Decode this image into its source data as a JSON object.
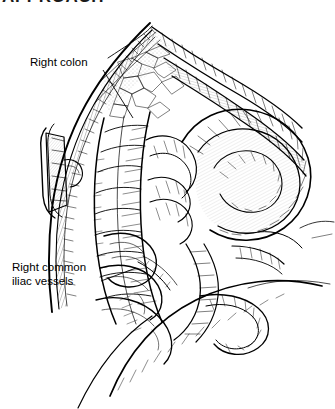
{
  "page": {
    "header_text": "APPROACH",
    "background_color": "#ffffff",
    "ink_color": "#000000",
    "width": 335,
    "height": 409
  },
  "figure": {
    "style": "pen-and-ink line drawing with cross-hatching",
    "medium": "black and white medical illustration"
  },
  "annotations": [
    {
      "id": "right-colon",
      "text": "Right colon",
      "lines": [
        "Right colon"
      ],
      "leader_from": {
        "x": 103,
        "y": 70
      },
      "leader_to": {
        "x": 133,
        "y": 118
      }
    },
    {
      "id": "right-common-iliac-vessels",
      "text": "Right common iliac vessels",
      "lines": [
        "Right common",
        "iliac vessels"
      ],
      "leader_from": {
        "x": 101,
        "y": 281
      },
      "leader_to": {
        "x": 136,
        "y": 268
      }
    }
  ],
  "structures": [
    {
      "name": "abdominal-incision-edge",
      "label": "Abdominal incision edge"
    },
    {
      "name": "surgical-retractor-clamp",
      "label": "Surgical retractor clamp"
    },
    {
      "name": "right-colon",
      "label": "Right colon"
    },
    {
      "name": "small-bowel-loops",
      "label": "Loops of small bowel"
    },
    {
      "name": "retracting-hand",
      "label": "Surgeon's retracting hand"
    },
    {
      "name": "right-common-iliac-vessels",
      "label": "Right common iliac vessels"
    }
  ]
}
